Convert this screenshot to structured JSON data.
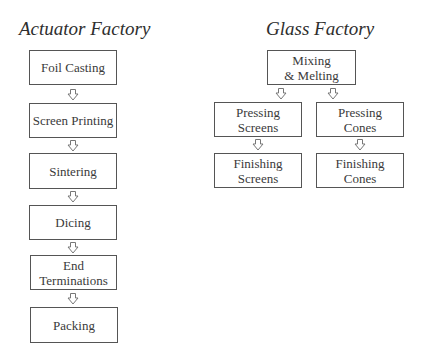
{
  "diagrams": {
    "actuator": {
      "title": "Actuator Factory",
      "steps": [
        "Foil Casting",
        "Screen Printing",
        "Sintering",
        "Dicing",
        "End\nTerminations",
        "Packing"
      ]
    },
    "glass": {
      "title": "Glass Factory",
      "root": "Mixing\n& Melting",
      "branches": [
        {
          "press": "Pressing\nScreens",
          "finish": "Finishing\nScreens"
        },
        {
          "press": "Pressing\nCones",
          "finish": "Finishing\nCones"
        }
      ]
    }
  },
  "colors": {
    "box_border": "#555555",
    "text": "#3a3a3a",
    "arrow": "#777777"
  },
  "icons": {
    "arrow": "hollow-down-arrow"
  }
}
